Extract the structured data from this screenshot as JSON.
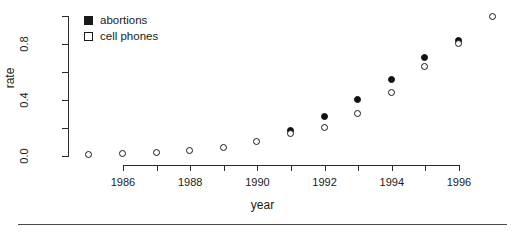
{
  "chart_data": {
    "type": "scatter",
    "title": "",
    "xlabel": "year",
    "ylabel": "rate",
    "xlim": [
      1984.5,
      1997.6
    ],
    "ylim": [
      0.0,
      1.02
    ],
    "grid": false,
    "legend_position": "top-left-inside",
    "x_ticks_major": [
      1986,
      1988,
      1990,
      1992,
      1994,
      1996
    ],
    "x_ticks_minor": [
      1987,
      1989,
      1991,
      1993,
      1995
    ],
    "x_tick_labels": [
      "1986",
      "1988",
      "1990",
      "1992",
      "1994",
      "1996"
    ],
    "y_ticks_major": [
      0.0,
      0.4,
      0.8
    ],
    "y_ticks_minor": [
      0.2,
      0.6,
      1.0
    ],
    "y_tick_labels": [
      "0.0",
      "0.4",
      "0.8"
    ],
    "series": [
      {
        "name": "abortions",
        "marker": "filled-circle",
        "color": "#111111",
        "x": [
          1991,
          1992,
          1993,
          1994,
          1995,
          1996
        ],
        "values": [
          0.18,
          0.28,
          0.4,
          0.54,
          0.7,
          0.82
        ]
      },
      {
        "name": "cell phones",
        "marker": "open-circle",
        "color": "#1a1a1a",
        "x": [
          1985,
          1986,
          1987,
          1988,
          1989,
          1990,
          1991,
          1992,
          1993,
          1994,
          1995,
          1996,
          1997
        ],
        "values": [
          0.005,
          0.012,
          0.025,
          0.035,
          0.055,
          0.1,
          0.155,
          0.2,
          0.3,
          0.45,
          0.635,
          0.8,
          0.99
        ]
      }
    ]
  },
  "legend": {
    "items": [
      {
        "label": "abortions",
        "marker": "filled-square"
      },
      {
        "label": "cell phones",
        "marker": "open-square"
      }
    ]
  },
  "axes": {
    "x_title": "year",
    "y_title": "rate"
  }
}
